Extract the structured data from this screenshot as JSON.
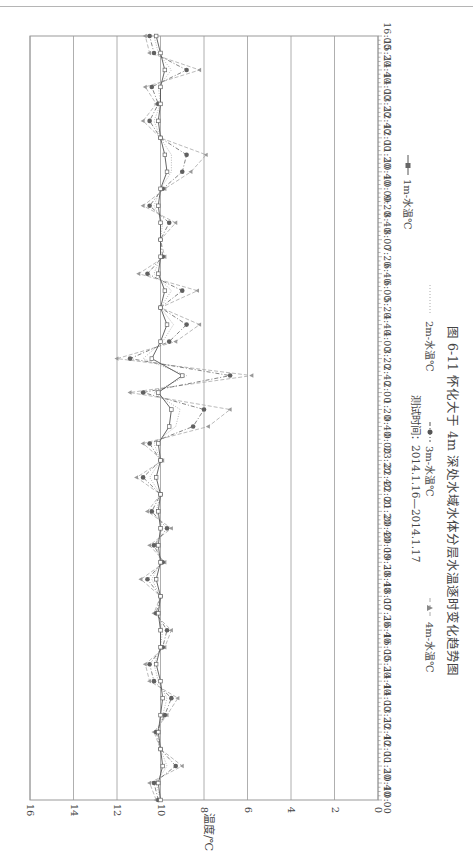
{
  "page": {
    "header_fragment": "…"
  },
  "figure": {
    "caption": "图 6-11   怀化大于 4m 深处水域水体分层水温逐时变化趋势图",
    "subtitle": "测试时间：2014.1.16—2014.1.17"
  },
  "chart_data": {
    "type": "line",
    "orientation": "rotated-90-clockwise",
    "title": "怀化大于 4m 深处水域水体分层水温逐时变化趋势图",
    "subtitle": "测试时间：2014.1.16—2014.1.17",
    "xlabel": "",
    "ylabel": "温度/℃",
    "ylim": [
      0,
      16
    ],
    "yticks": [
      0,
      2,
      4,
      6,
      8,
      10,
      12,
      14,
      16
    ],
    "grid": true,
    "legend_position": "right (bottom when rotated upright)",
    "categories": [
      "10:00",
      "10:40",
      "11:20",
      "12:00",
      "12:40",
      "13:20",
      "14:00",
      "14:40",
      "15:20",
      "16:00",
      "16:40",
      "17:20",
      "18:00",
      "18:40",
      "19:20",
      "20:00",
      "20:40",
      "21:20",
      "22:00",
      "22:40",
      "23:20",
      "0:00",
      "0:40",
      "1:20",
      "2:00",
      "2:40",
      "3:20",
      "4:00",
      "4:40",
      "5:20",
      "6:00",
      "6:40",
      "7:20",
      "8:00",
      "8:40",
      "9:20",
      "10:00",
      "10:40",
      "11:20",
      "12:00",
      "12:40",
      "13:20",
      "14:00",
      "14:40",
      "15:20",
      "16:00"
    ],
    "series": [
      {
        "name": "1m-水温℃",
        "marker": "square",
        "style": "solid",
        "values": [
          10.0,
          10.1,
          9.9,
          10.0,
          10.1,
          10.0,
          9.9,
          10.0,
          10.2,
          10.0,
          10.0,
          10.1,
          10.0,
          10.2,
          10.0,
          10.1,
          10.0,
          10.1,
          10.0,
          10.2,
          10.0,
          10.1,
          9.6,
          9.5,
          10.1,
          9.0,
          10.4,
          10.0,
          9.7,
          10.0,
          9.8,
          10.1,
          10.0,
          10.0,
          10.0,
          10.1,
          10.0,
          9.7,
          9.8,
          10.0,
          10.1,
          10.0,
          10.0,
          9.8,
          10.0,
          10.2
        ]
      },
      {
        "name": "2m-水温℃",
        "marker": "none",
        "style": "dotted",
        "values": [
          10.0,
          10.2,
          9.7,
          10.0,
          10.1,
          9.9,
          9.7,
          10.1,
          10.3,
          10.0,
          9.9,
          10.1,
          10.0,
          10.4,
          10.0,
          10.2,
          9.9,
          10.2,
          10.0,
          10.5,
          10.0,
          10.3,
          9.3,
          9.1,
          10.3,
          8.8,
          10.8,
          9.9,
          9.4,
          10.0,
          9.5,
          10.3,
          10.0,
          10.0,
          9.9,
          10.3,
          10.0,
          9.5,
          9.5,
          10.0,
          10.3,
          10.0,
          10.1,
          9.5,
          10.1,
          10.3
        ]
      },
      {
        "name": "3m-水温℃",
        "marker": "circle",
        "style": "dash-dot",
        "values": [
          10.1,
          10.3,
          9.3,
          10.0,
          10.2,
          9.8,
          9.5,
          10.3,
          10.5,
          9.9,
          9.7,
          10.2,
          10.0,
          10.6,
          9.9,
          10.3,
          9.7,
          10.4,
          10.0,
          10.8,
          10.0,
          10.5,
          8.5,
          8.0,
          10.8,
          6.8,
          11.4,
          9.6,
          8.8,
          10.0,
          9.0,
          10.6,
          9.9,
          10.0,
          9.6,
          10.5,
          9.9,
          9.0,
          8.8,
          10.0,
          10.5,
          10.1,
          10.4,
          8.8,
          10.3,
          10.5
        ]
      },
      {
        "name": "4m-水温℃",
        "marker": "triangle",
        "style": "dashed",
        "values": [
          10.2,
          10.5,
          9.0,
          10.0,
          10.3,
          9.7,
          9.2,
          10.5,
          10.7,
          9.8,
          9.5,
          10.3,
          10.0,
          10.9,
          9.8,
          10.5,
          9.5,
          10.6,
          10.0,
          11.1,
          9.9,
          10.8,
          7.8,
          6.8,
          11.4,
          5.8,
          12.0,
          9.3,
          8.2,
          10.0,
          8.3,
          11.0,
          9.8,
          10.0,
          9.3,
          10.8,
          9.8,
          8.6,
          7.9,
          10.0,
          10.8,
          10.2,
          10.7,
          8.2,
          10.5,
          10.7
        ]
      }
    ]
  },
  "axes": {
    "y_label": "温度/℃",
    "y_ticks": [
      "16",
      "14",
      "12",
      "10",
      "8",
      "6",
      "4",
      "2",
      "0"
    ],
    "x_ticks": [
      "10:00",
      "10:40",
      "11:20",
      "12:00",
      "12:40",
      "13:20",
      "14:00",
      "14:40",
      "15:20",
      "16:00",
      "16:40",
      "17:20",
      "18:00",
      "18:40",
      "19:20",
      "20:00",
      "20:40",
      "21:20",
      "22:00",
      "22:40",
      "23:20",
      "0:00",
      "0:40",
      "1:20",
      "2:00",
      "2:40",
      "3:20",
      "4:00",
      "4:40",
      "5:20",
      "6:00",
      "6:40",
      "7:20",
      "8:00",
      "8:40",
      "9:20",
      "10:00",
      "10:40",
      "11:20",
      "12:00",
      "12:40",
      "13:20",
      "14:00",
      "14:40",
      "15:20",
      "16:00"
    ]
  },
  "legend": [
    {
      "label": "1m-水温℃",
      "marker": "square"
    },
    {
      "label": "2m-水温℃",
      "marker": "none"
    },
    {
      "label": "3m-水温℃",
      "marker": "circle"
    },
    {
      "label": "4m-水温℃",
      "marker": "triangle"
    }
  ]
}
